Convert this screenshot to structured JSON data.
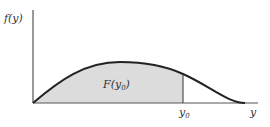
{
  "diagram": {
    "type": "probability-density-with-cdf-area",
    "y_axis_label": "f(y)",
    "x_axis_label": "y",
    "area_label": {
      "main": "F(y",
      "subscript": "0",
      "close": ")"
    },
    "marker_label": {
      "main": "y",
      "subscript": "0"
    },
    "colors": {
      "curve": "#222222",
      "axis": "#555555",
      "shade": "#dcdcdc",
      "text": "#333333"
    }
  }
}
